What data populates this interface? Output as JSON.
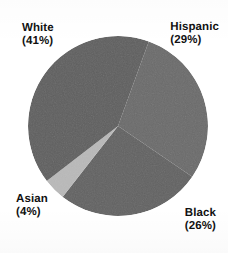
{
  "chart_data": {
    "type": "pie",
    "title": "",
    "subtitle": "",
    "xlabel": "",
    "ylabel": "",
    "grid": false,
    "legend_position": "outside-labels",
    "units": "percent",
    "start_angle_deg": 20,
    "direction": "clockwise",
    "categories": [
      "Hispanic",
      "Black",
      "Asian",
      "White"
    ],
    "values": [
      29,
      26,
      4,
      41
    ],
    "labels": [
      {
        "name": "White",
        "percent": 41,
        "text": "White",
        "value_text": "(41%)",
        "color": "#5f5f5f",
        "position": "upper-left"
      },
      {
        "name": "Hispanic",
        "percent": 29,
        "text": "Hispanic",
        "value_text": "(29%)",
        "color": "#6b6b6b",
        "position": "upper-right"
      },
      {
        "name": "Black",
        "percent": 26,
        "text": "Black",
        "value_text": "(26%)",
        "color": "#626262",
        "position": "lower-right"
      },
      {
        "name": "Asian",
        "percent": 4,
        "text": "Asian",
        "value_text": "(4%)",
        "color": "#b9b9b9",
        "position": "lower-left"
      }
    ]
  },
  "pie": {
    "center_x": 118,
    "center_y": 126,
    "radius": 90,
    "background": "#ffffff",
    "colors": {
      "white_slice": "#5f5f5f",
      "hispanic_slice": "#6b6b6b",
      "black_slice": "#626262",
      "asian_slice": "#b9b9b9",
      "label_text": "#111111"
    }
  },
  "labels": {
    "white": {
      "name": "White",
      "pct": "(41%)"
    },
    "hispanic": {
      "name": "Hispanic",
      "pct": "(29%)"
    },
    "asian": {
      "name": "Asian",
      "pct": "(4%)"
    },
    "black": {
      "name": "Black",
      "pct": "(26%)"
    }
  }
}
